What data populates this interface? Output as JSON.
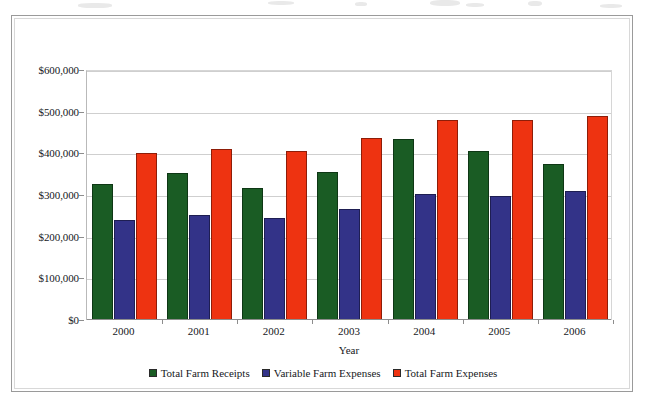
{
  "chart_data": {
    "type": "bar",
    "title": "",
    "xlabel": "Year",
    "ylabel": "",
    "categories": [
      "2000",
      "2001",
      "2002",
      "2003",
      "2004",
      "2005",
      "2006"
    ],
    "series": [
      {
        "name": "Total Farm Receipts",
        "color": "#1a5c24",
        "values": [
          326000,
          352000,
          318000,
          355000,
          435000,
          405000,
          375000
        ]
      },
      {
        "name": "Variable Farm Expenses",
        "color": "#333388",
        "values": [
          240000,
          252000,
          245000,
          267000,
          302000,
          298000,
          310000
        ]
      },
      {
        "name": "Total Farm Expenses",
        "color": "#ee3311",
        "values": [
          400000,
          410000,
          405000,
          438000,
          480000,
          480000,
          490000
        ]
      }
    ],
    "ylim": [
      0,
      600000
    ],
    "ytick_values": [
      0,
      100000,
      200000,
      300000,
      400000,
      500000,
      600000
    ],
    "ytick_labels": [
      "$0",
      "$100,000",
      "$200,000",
      "$300,000",
      "$400,000",
      "$500,000",
      "$600,000"
    ],
    "grid": true,
    "legend_position": "bottom"
  }
}
